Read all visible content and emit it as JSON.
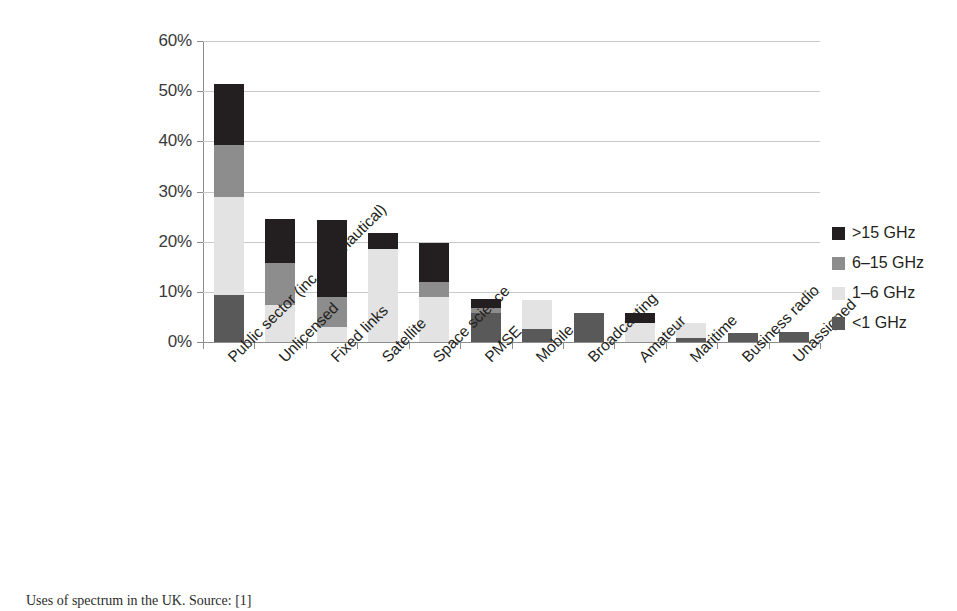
{
  "figure": {
    "caption": "Uses of spectrum in the UK. Source: [1]"
  },
  "legend": {
    "position": "right",
    "entries": [
      {
        "label": ">15 GHz",
        "color": "#231f20"
      },
      {
        "label": "6–15 GHz",
        "color": "#8d8d8d"
      },
      {
        "label": "1–6 GHz",
        "color": "#e3e3e3"
      },
      {
        "label": "<1 GHz",
        "color": "#595959"
      }
    ]
  },
  "axes": {
    "y_ticks": [
      "0%",
      "10%",
      "20%",
      "30%",
      "40%",
      "50%",
      "60%"
    ],
    "y_min": 0,
    "y_max": 60
  },
  "chart_data": {
    "type": "bar",
    "title": "",
    "subtitle": "",
    "xlabel": "",
    "ylabel": "",
    "ylim": [
      0,
      60
    ],
    "ytick_values": [
      0,
      10,
      20,
      30,
      40,
      50,
      60
    ],
    "ytick_labels": [
      "0%",
      "10%",
      "20%",
      "30%",
      "40%",
      "50%",
      "60%"
    ],
    "grid": true,
    "stacked": true,
    "legend_position": "right",
    "units": "percent",
    "categories": [
      "Public sector (inc. aeronautical)",
      "Unlicensed",
      "Fixed links",
      "Satellite",
      "Space science",
      "PMSE",
      "Mobile",
      "Broadcasting",
      "Amateur",
      "Maritime",
      "Business radio",
      "Unassigned"
    ],
    "series": [
      {
        "name": "<1 GHz",
        "color": "#595959",
        "values": [
          9.3,
          0.0,
          0.0,
          0.0,
          0.0,
          5.8,
          2.5,
          5.8,
          0.0,
          0.8,
          1.8,
          2.0
        ]
      },
      {
        "name": "1–6 GHz",
        "color": "#e3e3e3",
        "values": [
          19.7,
          7.3,
          3.0,
          18.5,
          9.0,
          0.0,
          5.8,
          0.0,
          3.8,
          3.0,
          0.0,
          0.0
        ]
      },
      {
        "name": "6–15 GHz",
        "color": "#8d8d8d",
        "values": [
          10.3,
          8.5,
          5.9,
          0.0,
          3.0,
          1.0,
          0.0,
          0.0,
          0.0,
          0.0,
          0.0,
          0.0
        ]
      },
      {
        "name": ">15 GHz",
        "color": "#231f20",
        "values": [
          12.2,
          8.7,
          15.5,
          3.3,
          7.8,
          1.8,
          0.0,
          0.0,
          2.0,
          0.0,
          0.0,
          0.0
        ]
      }
    ],
    "totals": [
      51.5,
      24.5,
      24.4,
      21.8,
      19.8,
      8.6,
      8.3,
      5.8,
      5.8,
      3.8,
      1.8,
      2.0
    ]
  }
}
